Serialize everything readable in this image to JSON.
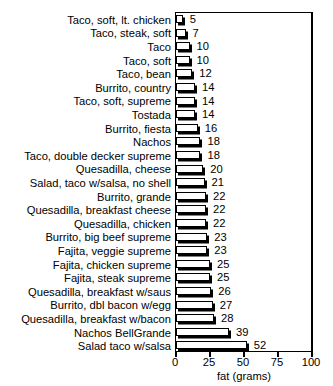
{
  "chart_data": {
    "type": "bar",
    "orientation": "horizontal",
    "title": "",
    "xlabel": "fat (grams)",
    "ylabel": "",
    "xlim": [
      0,
      100
    ],
    "xticks": [
      0,
      25,
      50,
      75,
      100
    ],
    "grid": false,
    "legend": false,
    "categories": [
      "Taco, soft, lt. chicken",
      "Taco, steak, soft",
      "Taco",
      "Taco, soft",
      "Taco, bean",
      "Burrito, country",
      "Taco, soft, supreme",
      "Tostada",
      "Burrito, fiesta",
      "Nachos",
      "Taco, double decker supreme",
      "Quesadilla, cheese",
      "Salad, taco w/salsa, no shell",
      "Burrito, grande",
      "Quesadilla, breakfast cheese",
      "Quesadilla, chicken",
      "Burrito, big beef supreme",
      "Fajita, veggie supreme",
      "Fajita, chicken supreme",
      "Fajita, steak supreme",
      "Quesadilla, breakfast w/saus",
      "Burrito, dbl bacon w/egg",
      "Quesadilla, breakfast w/bacon",
      "Nachos BellGrande",
      "Salad taco w/salsa"
    ],
    "values": [
      5,
      7,
      10,
      10,
      12,
      14,
      14,
      14,
      16,
      18,
      18,
      20,
      21,
      22,
      22,
      22,
      23,
      23,
      25,
      25,
      26,
      27,
      28,
      39,
      52
    ]
  },
  "title_remnant": "......  ...   ....  ..  ...."
}
